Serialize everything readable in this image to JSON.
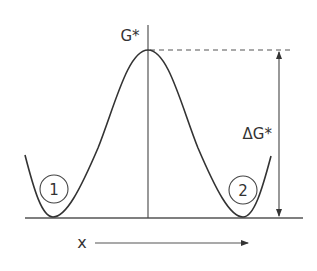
{
  "diagram": {
    "labels": {
      "peak": "G*",
      "barrier": "ΔG*",
      "axis": "x",
      "state_1": "1",
      "state_2": "2"
    },
    "colors": {
      "line": "#333333",
      "background": "#ffffff"
    }
  }
}
